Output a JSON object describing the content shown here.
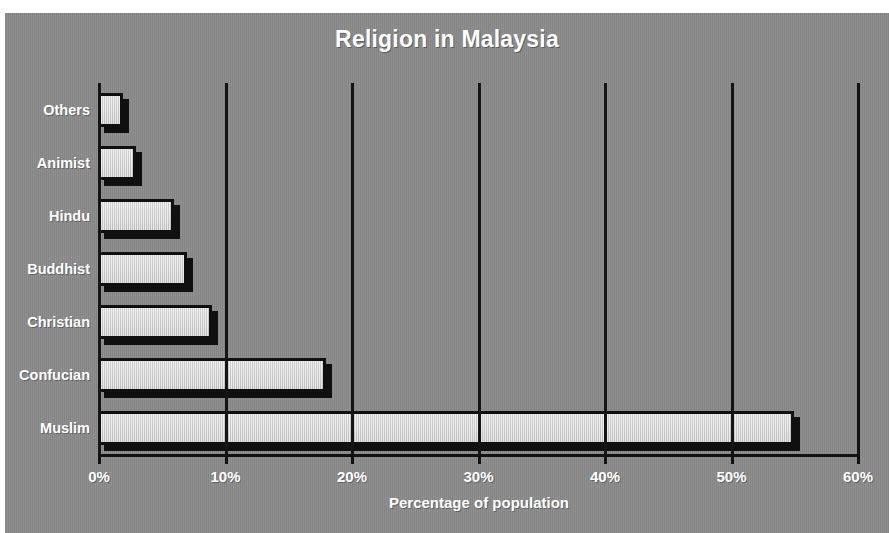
{
  "chart_data": {
    "type": "bar",
    "orientation": "horizontal",
    "title": "Religion in Malaysia",
    "xlabel": "Percentage of population",
    "ylabel": "",
    "categories": [
      "Muslim",
      "Confucian",
      "Christian",
      "Buddhist",
      "Hindu",
      "Animist",
      "Others"
    ],
    "values": [
      55,
      18,
      9,
      7,
      6,
      3,
      2
    ],
    "xlim": [
      0,
      60
    ],
    "xticks": [
      0,
      10,
      20,
      30,
      40,
      50,
      60
    ],
    "xtick_labels": [
      "0%",
      "10%",
      "20%",
      "30%",
      "40%",
      "50%",
      "60%"
    ],
    "grid": "vertical",
    "legend": "none",
    "value_unit": "%",
    "bars": [
      {
        "category": "Others",
        "value": 2
      },
      {
        "category": "Animist",
        "value": 3
      },
      {
        "category": "Hindu",
        "value": 6
      },
      {
        "category": "Buddhist",
        "value": 7
      },
      {
        "category": "Christian",
        "value": 9
      },
      {
        "category": "Confucian",
        "value": 18
      },
      {
        "category": "Muslim",
        "value": 55
      }
    ]
  },
  "style": {
    "background_color": "#8a8a8a",
    "bar_fill_color": "#d2d2d2",
    "bar_border_color": "#101010",
    "text_color": "#ffffff",
    "gridline_color": "#151515",
    "page_color": "#ffffff"
  }
}
